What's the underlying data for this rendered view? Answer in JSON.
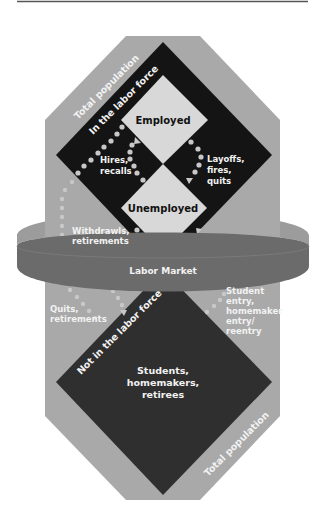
{
  "diagram": {
    "outer_region": {
      "label_top": "Total population",
      "label_bottom": "Total population"
    },
    "labor_force": {
      "label": "In the labor force",
      "states": [
        {
          "name": "Employed"
        },
        {
          "name": "Unemployed"
        }
      ]
    },
    "not_in_labor_force": {
      "label": "Not in the labor force",
      "members_line1": "Students,",
      "members_line2": "homemakers,",
      "members_line3": "retirees"
    },
    "market_band": {
      "label": "Labor Market"
    },
    "flows": {
      "hires": {
        "line1": "Hires,",
        "line2": "recalls"
      },
      "layoffs": {
        "line1": "Layoffs,",
        "line2": "fires,",
        "line3": "quits"
      },
      "withdrawals": {
        "line1": "Withdrawls,",
        "line2": "retirements"
      },
      "quits": {
        "line1": "Quits,",
        "line2": "retirements"
      },
      "entry": {
        "line1": "Student",
        "line2": "entry,",
        "line3": "homemaker",
        "line4": "entry/",
        "line5": "reentry"
      }
    },
    "colors": {
      "octagon": "#a9a9a9",
      "labor_force_diamond": "#141414",
      "state_diamonds": "#d8d8d8",
      "not_in_lf_diamond": "#2f2f2f",
      "band_front": "#6b6b6b",
      "band_inner": "#9c9c9c",
      "flow_dots": "#c8c8c8"
    }
  }
}
